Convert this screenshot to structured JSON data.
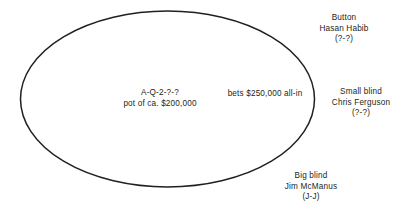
{
  "diagram": {
    "type": "poker-table-seating",
    "table_shape": "ellipse",
    "line_color": "#231f20",
    "background_color": "#ffffff"
  },
  "pot": {
    "board": "A-Q-2-?-?",
    "amount_line": "pot of ca. $200,000"
  },
  "action": {
    "bet_text": "bets $250,000 all-in"
  },
  "seats": [
    {
      "position": "Button",
      "player": "Hasan Habib",
      "hand": "(?-?)"
    },
    {
      "position": "Small blind",
      "player": "Chris Ferguson",
      "hand": "(?-?)"
    },
    {
      "position": "Big blind",
      "player": "Jim McManus",
      "hand": "(J-J)"
    }
  ]
}
